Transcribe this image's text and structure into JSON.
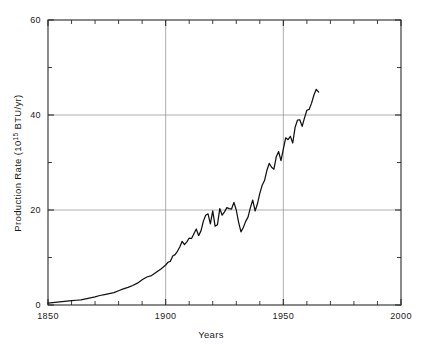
{
  "chart_data": {
    "type": "line",
    "title": "",
    "xlabel": "Years",
    "ylabel_main": "Production Rate (10",
    "ylabel_sup": "15",
    "ylabel_tail": " BTU/yr)",
    "ylabel_full": "Production Rate (10^15 BTU/yr)",
    "xlim": [
      1850,
      2000
    ],
    "ylim": [
      0,
      60
    ],
    "grid": "major gridlines at x=1900,1950 and y=20,40",
    "legend": "none",
    "x_major_ticks": [
      1850,
      1900,
      1950,
      2000
    ],
    "x_major_tick_labels": [
      "1850",
      "1900",
      "1950",
      "2000"
    ],
    "x_minor_ticks": [
      1860,
      1870,
      1880,
      1890,
      1910,
      1920,
      1930,
      1940,
      1960,
      1970,
      1980,
      1990
    ],
    "y_major_ticks": [
      0,
      20,
      40,
      60
    ],
    "y_major_tick_labels": [
      "0",
      "20",
      "40",
      "60"
    ],
    "y_minor_ticks": [
      10,
      30,
      50
    ],
    "x": [
      1850,
      1852,
      1854,
      1856,
      1858,
      1860,
      1862,
      1864,
      1866,
      1868,
      1870,
      1872,
      1874,
      1876,
      1878,
      1880,
      1882,
      1884,
      1886,
      1888,
      1890,
      1892,
      1894,
      1896,
      1898,
      1900,
      1901,
      1902,
      1903,
      1904,
      1905,
      1906,
      1907,
      1908,
      1909,
      1910,
      1911,
      1912,
      1913,
      1914,
      1915,
      1916,
      1917,
      1918,
      1919,
      1920,
      1921,
      1922,
      1923,
      1924,
      1925,
      1926,
      1927,
      1928,
      1929,
      1930,
      1931,
      1932,
      1933,
      1934,
      1935,
      1936,
      1937,
      1938,
      1939,
      1940,
      1941,
      1942,
      1943,
      1944,
      1945,
      1946,
      1947,
      1948,
      1949,
      1950,
      1951,
      1952,
      1953,
      1954,
      1955,
      1956,
      1957,
      1958,
      1959,
      1960,
      1961,
      1962,
      1963,
      1964,
      1965
    ],
    "y": [
      0.4,
      0.5,
      0.6,
      0.7,
      0.8,
      0.9,
      1.0,
      1.1,
      1.3,
      1.5,
      1.7,
      2.0,
      2.2,
      2.4,
      2.6,
      3.0,
      3.4,
      3.7,
      4.1,
      4.6,
      5.3,
      5.9,
      6.2,
      6.9,
      7.6,
      8.4,
      9.0,
      9.2,
      10.3,
      10.6,
      11.3,
      12.2,
      13.4,
      12.7,
      13.3,
      14.1,
      14.0,
      15.0,
      16.0,
      14.6,
      15.6,
      17.6,
      18.9,
      19.2,
      17.1,
      19.8,
      16.6,
      16.9,
      20.3,
      18.9,
      19.6,
      20.5,
      20.3,
      20.2,
      21.6,
      20.0,
      17.4,
      15.4,
      16.3,
      17.6,
      18.5,
      20.5,
      22.1,
      19.8,
      21.3,
      23.5,
      25.2,
      26.2,
      28.3,
      29.8,
      29.0,
      28.6,
      31.2,
      32.3,
      30.4,
      32.8,
      35.2,
      34.8,
      35.5,
      34.1,
      37.4,
      38.9,
      39.0,
      37.6,
      39.4,
      41.0,
      41.2,
      42.5,
      44.2,
      45.4,
      44.8
    ]
  }
}
